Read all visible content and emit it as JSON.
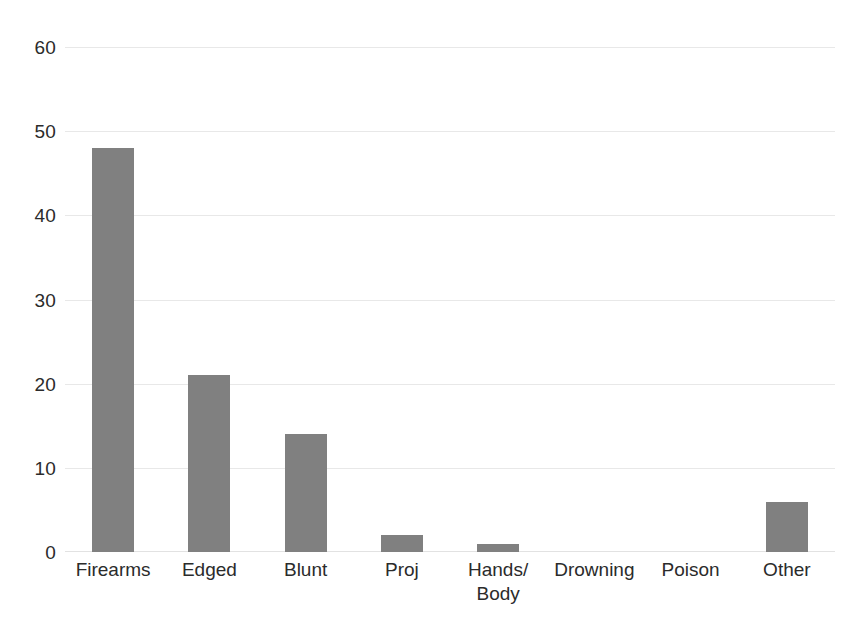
{
  "chart_data": {
    "type": "bar",
    "title": "",
    "subtitle": "",
    "xlabel": "",
    "ylabel": "",
    "categories": [
      "Firearms",
      "Edged",
      "Blunt",
      "Proj",
      "Hands/\nBody",
      "Drowning",
      "Poison",
      "Other"
    ],
    "values": [
      48,
      21,
      14,
      2,
      1,
      0,
      0,
      6
    ],
    "ylim": [
      0,
      60
    ],
    "ytick_labels": [
      "60",
      "50",
      "40",
      "30",
      "20",
      "10",
      "0"
    ],
    "ytick_values": [
      60,
      50,
      40,
      30,
      20,
      10,
      0
    ],
    "grid": true,
    "legend": false,
    "legend_position": "none",
    "bar_color": "#808080",
    "gridline_color": "#e8e8e8",
    "text_color": "#2b2b2b",
    "background_color": "#ffffff"
  }
}
